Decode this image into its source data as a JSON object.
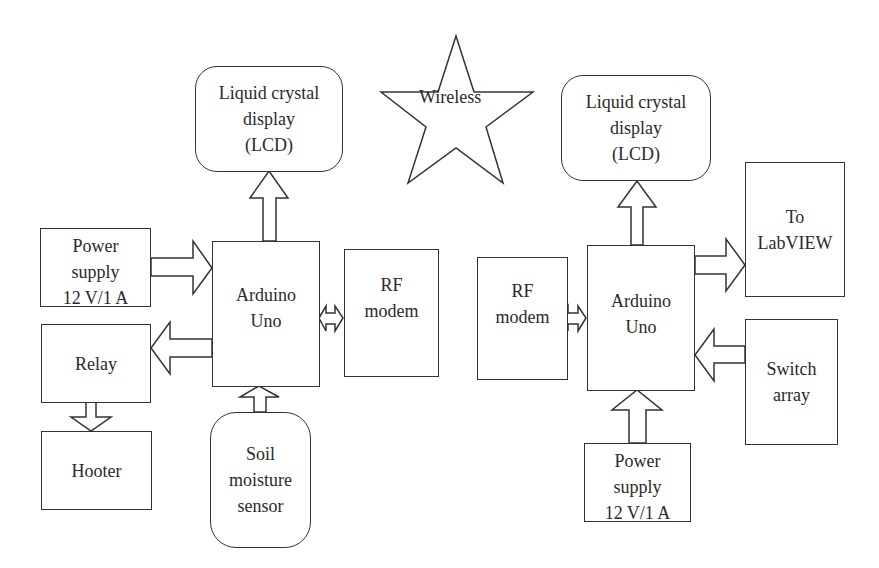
{
  "diagram": {
    "left_unit": {
      "lcd": {
        "line1": "Liquid crystal",
        "line2": "display",
        "line3": "(LCD)"
      },
      "power_supply": {
        "line1": "Power",
        "line2": "supply",
        "line3": "12 V/1 A"
      },
      "arduino": {
        "line1": "Arduino",
        "line2": "Uno"
      },
      "rf_modem": {
        "line1": "RF",
        "line2": "modem"
      },
      "relay": {
        "label": "Relay"
      },
      "hooter": {
        "label": "Hooter"
      },
      "soil_sensor": {
        "line1": "Soil",
        "line2": "moisture",
        "line3": "sensor"
      }
    },
    "wireless": {
      "label": "Wireless"
    },
    "right_unit": {
      "lcd": {
        "line1": "Liquid crystal",
        "line2": "display",
        "line3": "(LCD)"
      },
      "rf_modem": {
        "line1": "RF",
        "line2": "modem"
      },
      "arduino": {
        "line1": "Arduino",
        "line2": "Uno"
      },
      "labview": {
        "line1": "To",
        "line2": "LabVIEW"
      },
      "switch_array": {
        "line1": "Switch",
        "line2": "array"
      },
      "power_supply": {
        "line1": "Power",
        "line2": "supply",
        "line3": "12 V/1 A"
      }
    },
    "connections": [
      {
        "from": "left_unit.power_supply",
        "to": "left_unit.arduino"
      },
      {
        "from": "left_unit.arduino",
        "to": "left_unit.lcd"
      },
      {
        "from": "left_unit.arduino",
        "to": "left_unit.relay"
      },
      {
        "from": "left_unit.relay",
        "to": "left_unit.hooter"
      },
      {
        "from": "left_unit.soil_sensor",
        "to": "left_unit.arduino"
      },
      {
        "from": "left_unit.arduino",
        "to": "left_unit.rf_modem",
        "bidirectional": true
      },
      {
        "from": "right_unit.rf_modem",
        "to": "right_unit.arduino",
        "bidirectional": true
      },
      {
        "from": "right_unit.arduino",
        "to": "right_unit.lcd"
      },
      {
        "from": "right_unit.arduino",
        "to": "right_unit.labview"
      },
      {
        "from": "right_unit.switch_array",
        "to": "right_unit.arduino"
      },
      {
        "from": "right_unit.power_supply",
        "to": "right_unit.arduino"
      }
    ]
  }
}
